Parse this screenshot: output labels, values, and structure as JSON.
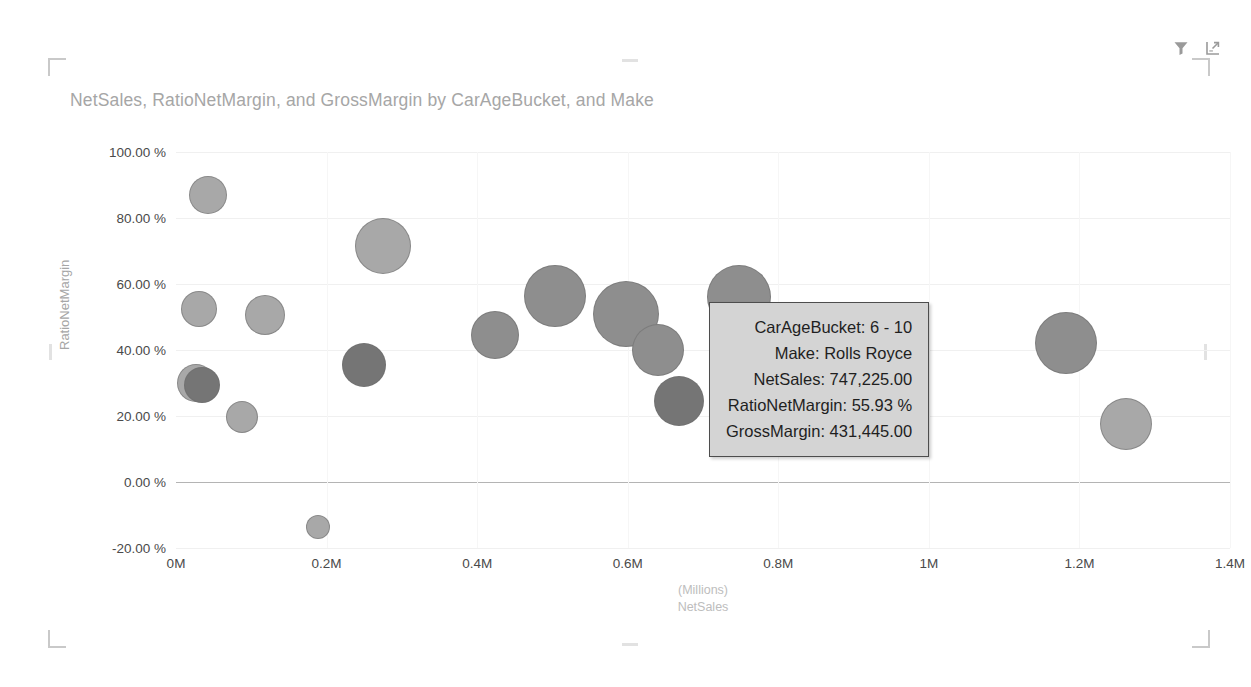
{
  "visual": {
    "title": "NetSales, RatioNetMargin, and GrossMargin by CarAgeBucket, and Make",
    "header_icons": [
      {
        "name": "filter-icon",
        "label": "Filters"
      },
      {
        "name": "focus-mode-icon",
        "label": "Focus mode"
      }
    ]
  },
  "tooltip": {
    "rows": [
      {
        "label": "CarAgeBucket:",
        "value": "6 - 10",
        "text": "CarAgeBucket: 6 - 10"
      },
      {
        "label": "Make:",
        "value": "Rolls Royce",
        "text": "Make: Rolls Royce"
      },
      {
        "label": "NetSales:",
        "value": "747,225.00",
        "text": "NetSales: 747,225.00"
      },
      {
        "label": "RatioNetMargin:",
        "value": "55.93 %",
        "text": "RatioNetMargin: 55.93 %"
      },
      {
        "label": "GrossMargin:",
        "value": "431,445.00",
        "text": "GrossMargin: 431,445.00"
      }
    ]
  },
  "colors": {
    "title": "#a6a6a6",
    "axis_label": "#4a4a4a",
    "axis_title": "#a6a6a6",
    "gridline": "#f0f0f0",
    "zero_line": "#b4b4b4",
    "bubble_light": "#a8a8a8",
    "bubble_mid": "#8e8e8e",
    "bubble_dark": "#757575",
    "tooltip_bg": "#d4d4d4",
    "tooltip_border": "#4d4d4d"
  },
  "chart_data": {
    "type": "scatter",
    "title": "NetSales, RatioNetMargin, and GrossMargin by CarAgeBucket, and Make",
    "subtitle": "",
    "xlabel": "NetSales",
    "xlabel_units": "(Millions)",
    "ylabel": "RatioNetMargin",
    "xlim": [
      0,
      1400000
    ],
    "ylim": [
      -20,
      100
    ],
    "grid": true,
    "legend": "none",
    "x_ticks": [
      "0M",
      "0.2M",
      "0.4M",
      "0.6M",
      "0.8M",
      "1M",
      "1.2M",
      "1.4M"
    ],
    "x_tick_values": [
      0,
      200000,
      400000,
      600000,
      800000,
      1000000,
      1200000,
      1400000
    ],
    "y_ticks": [
      "100.00 %",
      "80.00 %",
      "60.00 %",
      "40.00 %",
      "20.00 %",
      "0.00 %",
      "-20.00 %"
    ],
    "y_tick_values": [
      100,
      80,
      60,
      40,
      20,
      0,
      -20
    ],
    "size_field": "GrossMargin",
    "points": [
      {
        "x": 42000,
        "y": 87.0,
        "r": 19,
        "shade": "light"
      },
      {
        "x": 30000,
        "y": 52.5,
        "r": 18,
        "shade": "light"
      },
      {
        "x": 118000,
        "y": 50.5,
        "r": 20,
        "shade": "light"
      },
      {
        "x": 26000,
        "y": 30.0,
        "r": 19,
        "shade": "light"
      },
      {
        "x": 34000,
        "y": 29.5,
        "r": 18,
        "shade": "dark"
      },
      {
        "x": 88000,
        "y": 19.8,
        "r": 16,
        "shade": "light"
      },
      {
        "x": 275000,
        "y": 71.5,
        "r": 28,
        "shade": "light"
      },
      {
        "x": 250000,
        "y": 35.5,
        "r": 22,
        "shade": "dark"
      },
      {
        "x": 188000,
        "y": -13.5,
        "r": 12,
        "shade": "light"
      },
      {
        "x": 424000,
        "y": 44.5,
        "r": 24,
        "shade": "mid"
      },
      {
        "x": 504000,
        "y": 56.5,
        "r": 31,
        "shade": "mid"
      },
      {
        "x": 598000,
        "y": 51.0,
        "r": 33,
        "shade": "mid"
      },
      {
        "x": 640000,
        "y": 40.0,
        "r": 26,
        "shade": "mid"
      },
      {
        "x": 668000,
        "y": 24.5,
        "r": 25,
        "shade": "dark"
      },
      {
        "x": 747225,
        "y": 55.93,
        "r": 32,
        "shade": "mid"
      },
      {
        "x": 1182000,
        "y": 42.0,
        "r": 31,
        "shade": "mid"
      },
      {
        "x": 1262000,
        "y": 17.5,
        "r": 26,
        "shade": "light"
      }
    ]
  }
}
